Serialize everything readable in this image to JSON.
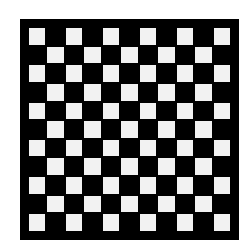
{
  "board": {
    "rows": 11,
    "cols": 11,
    "light_color": "#f2f2f2",
    "dark_color": "#000000",
    "border_color": "#000000",
    "top_left_color": "light"
  }
}
